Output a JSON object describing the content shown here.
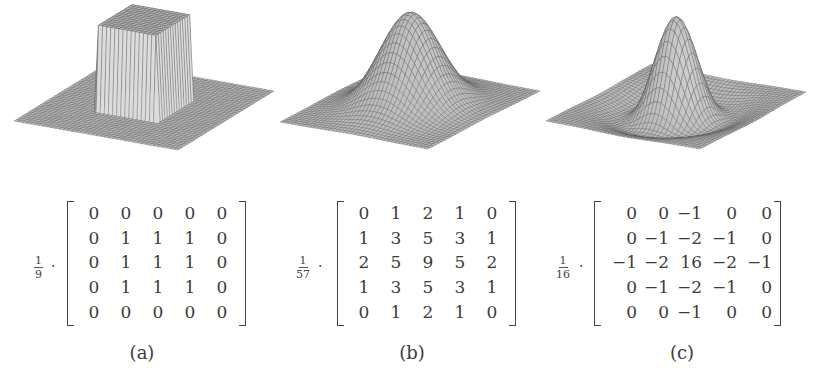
{
  "figure": {
    "panels": [
      {
        "id": "a",
        "caption": "(a)",
        "surface_type": "box-filter",
        "description": "3D mesh of a box (mean) filter: flat plane with raised square block",
        "scale": {
          "numerator": "1",
          "denominator": "9"
        },
        "multiplier": "·",
        "kernel": [
          [
            "0",
            "0",
            "0",
            "0",
            "0"
          ],
          [
            "0",
            "1",
            "1",
            "1",
            "0"
          ],
          [
            "0",
            "1",
            "1",
            "1",
            "0"
          ],
          [
            "0",
            "1",
            "1",
            "1",
            "0"
          ],
          [
            "0",
            "0",
            "0",
            "0",
            "0"
          ]
        ]
      },
      {
        "id": "b",
        "caption": "(b)",
        "surface_type": "gaussian",
        "description": "3D mesh of a Gaussian smoothing kernel: single smooth bell-shaped peak",
        "scale": {
          "numerator": "1",
          "denominator": "57"
        },
        "multiplier": "·",
        "kernel": [
          [
            "0",
            "1",
            "2",
            "1",
            "0"
          ],
          [
            "1",
            "3",
            "5",
            "3",
            "1"
          ],
          [
            "2",
            "5",
            "9",
            "5",
            "2"
          ],
          [
            "1",
            "3",
            "5",
            "3",
            "1"
          ],
          [
            "0",
            "1",
            "2",
            "1",
            "0"
          ]
        ]
      },
      {
        "id": "c",
        "caption": "(c)",
        "surface_type": "laplacian-of-gaussian",
        "description": "3D mesh of a Laplacian-of-Gaussian (Mexican hat): sharp central peak with surrounding negative trough",
        "scale": {
          "numerator": "1",
          "denominator": "16"
        },
        "multiplier": "·",
        "kernel": [
          [
            "0",
            "0",
            "−1",
            "0",
            "0"
          ],
          [
            "0",
            "−1",
            "−2",
            "−1",
            "0"
          ],
          [
            "−1",
            "−2",
            "16",
            "−2",
            "−1"
          ],
          [
            "0",
            "−1",
            "−2",
            "−1",
            "0"
          ],
          [
            "0",
            "0",
            "−1",
            "0",
            "0"
          ]
        ]
      }
    ],
    "colors": {
      "background": "#ffffff",
      "mesh_fill": "#b4b4b4",
      "mesh_line": "#5a5a5a",
      "text": "#3c3c3c"
    }
  }
}
